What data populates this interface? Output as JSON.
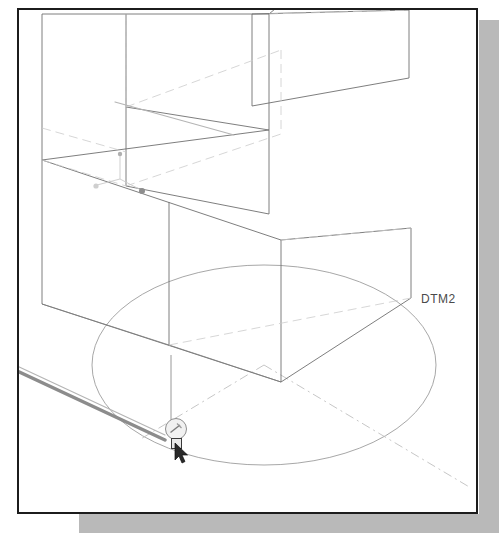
{
  "application": {
    "kind": "cad-3d-modeling-viewport",
    "view_orientation": "isometric-trimetric-wireframe"
  },
  "viewport": {
    "background_color": "#ffffff",
    "frame_color": "#1c1c1c",
    "shadow_color": "#b9b9b9",
    "width_px": 499,
    "height_px": 533
  },
  "labels": {
    "datum_plane_tag": "DTM2"
  },
  "colors": {
    "visible_edge": "#6f6f6f",
    "hidden_edge": "#c8c8c8",
    "datum_plane_outline": "#9a9a9a",
    "datum_centerline": "#bdbdbd",
    "highlighted_edge": "#8a8a8a",
    "csys_axis": "#c2c2c2",
    "label_text": "#4a4a4a",
    "snap_indicator_fill": "#f1f1f1",
    "snap_indicator_stroke": "#8e8e8e",
    "pick_box_stroke": "#3a3a3a",
    "cursor_fill": "#2a2a2a"
  },
  "icons": {
    "coordinate_system": "csys-triad-icon",
    "snap_indicator": "snap-point-icon",
    "pick_box": "selection-pick-box-icon",
    "cursor": "mouse-arrow-cursor-icon"
  },
  "geometry": {
    "model_description": "L-shaped / stepped extruded solid block shown in wireframe with hidden lines",
    "datum_plane": {
      "name": "DTM2",
      "shape": "ellipse",
      "center_x": 262,
      "center_y": 363,
      "radius_x": 172,
      "radius_y": 100
    },
    "csys_triad": {
      "origin_x": 118,
      "origin_y": 177,
      "axis_count": 3
    },
    "selected_edge": {
      "from_x": 16,
      "from_y": 369,
      "to_x": 160,
      "to_y": 437,
      "state": "highlighted"
    }
  }
}
